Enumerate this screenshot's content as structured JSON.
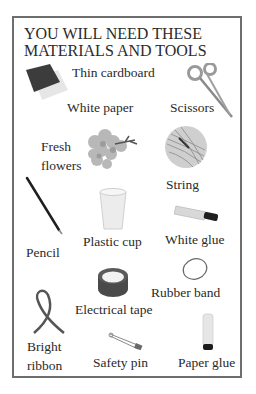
{
  "header": {
    "title_line1": "YOU WILL NEED THESE",
    "title_line2": "MATERIALS AND TOOLS"
  },
  "items": [
    {
      "label": "Thin cardboard",
      "icon": "cardboard-icon"
    },
    {
      "label": "White paper",
      "icon": "paper-icon"
    },
    {
      "label": "Scissors",
      "icon": "scissors-icon"
    },
    {
      "label_line1": "Fresh",
      "label_line2": "flowers",
      "icon": "flowers-icon"
    },
    {
      "label": "String",
      "icon": "string-ball-icon"
    },
    {
      "label": "Pencil",
      "icon": "pencil-icon"
    },
    {
      "label": "Plastic cup",
      "icon": "plastic-cup-icon"
    },
    {
      "label": "White glue",
      "icon": "glue-tube-icon"
    },
    {
      "label": "Rubber band",
      "icon": "rubber-band-icon"
    },
    {
      "label": "Electrical tape",
      "icon": "tape-roll-icon"
    },
    {
      "label_line1": "Bright",
      "label_line2": "ribbon",
      "icon": "ribbon-icon"
    },
    {
      "label": "Safety pin",
      "icon": "safety-pin-icon"
    },
    {
      "label": "Paper glue",
      "icon": "glue-stick-icon"
    }
  ],
  "colors": {
    "border": "#6e6e6e",
    "text": "#2a2a2a",
    "cardboard": "#3a3a3a",
    "tape": "#4a4a4a"
  }
}
